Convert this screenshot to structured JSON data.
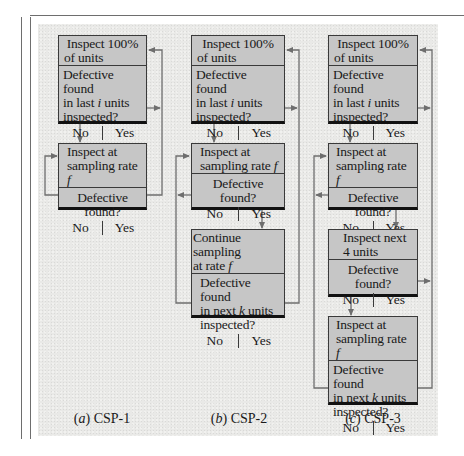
{
  "figure": {
    "colors": {
      "box_fill": "#c6c6c6",
      "box_border": "#3a3a3a",
      "panel_bg": "#e9e9e7",
      "connector": "#6e6e6e"
    },
    "panels": [
      {
        "id": "csp1",
        "caption_letter": "(a)",
        "caption_text": " CSP-1",
        "boxes": [
          {
            "head": [
              "Inspect 100%",
              "of units"
            ],
            "question": [
              "Defective found",
              "in last ",
              "i",
              " units",
              "inspected?"
            ],
            "no": "No",
            "yes": "Yes"
          },
          {
            "head": [
              "Inspect at",
              "sampling rate ",
              "f"
            ],
            "question": [
              "Defective found?"
            ],
            "no": "No",
            "yes": "Yes"
          }
        ]
      },
      {
        "id": "csp2",
        "caption_letter": "(b)",
        "caption_text": " CSP-2",
        "boxes": [
          {
            "head": [
              "Inspect 100%",
              "of units"
            ],
            "question": [
              "Defective found",
              "in last ",
              "i",
              " units",
              "inspected?"
            ],
            "no": "No",
            "yes": "Yes"
          },
          {
            "head": [
              "Inspect at",
              "sampling rate ",
              "f"
            ],
            "question": [
              "Defective found?"
            ],
            "no": "No",
            "yes": "Yes"
          },
          {
            "head": [
              "Continue sampling",
              "at rate ",
              "f"
            ],
            "question": [
              "Defective found",
              "in next ",
              "k",
              " units",
              "inspected?"
            ],
            "no": "No",
            "yes": "Yes"
          }
        ]
      },
      {
        "id": "csp3",
        "caption_letter": "(c)",
        "caption_text": " CSP-3",
        "boxes": [
          {
            "head": [
              "Inspect 100%",
              "of units"
            ],
            "question": [
              "Defective found",
              "in last ",
              "i",
              " units",
              "inspected?"
            ],
            "no": "No",
            "yes": "Yes"
          },
          {
            "head": [
              "Inspect at",
              "sampling rate ",
              "f"
            ],
            "question": [
              "Defective found?"
            ],
            "no": "No",
            "yes": "Yes"
          },
          {
            "head": [
              "Inspect next",
              "4 units"
            ],
            "question": [
              "Defective found?"
            ],
            "no": "No",
            "yes": "Yes"
          },
          {
            "head": [
              "Inspect at",
              "sampling rate ",
              "f"
            ],
            "question": [
              "Defective found",
              "in next ",
              "k",
              " units",
              "inspected?"
            ],
            "no": "No",
            "yes": "Yes"
          }
        ]
      }
    ]
  }
}
